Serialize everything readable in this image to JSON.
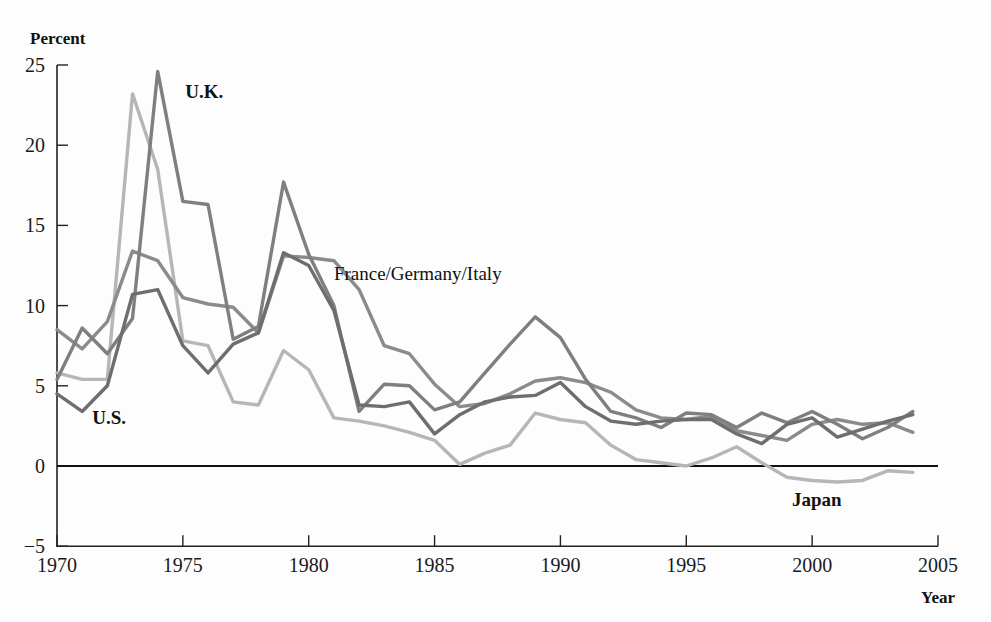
{
  "chart_data": {
    "type": "line",
    "title": "",
    "subtitle": "",
    "xlabel": "Year",
    "ylabel": "Percent",
    "xlim": [
      1970,
      2005
    ],
    "ylim": [
      -5,
      25
    ],
    "xticks": [
      1970,
      1975,
      1980,
      1985,
      1990,
      1995,
      2000,
      2005
    ],
    "yticks": [
      -5,
      0,
      5,
      10,
      15,
      20,
      25
    ],
    "xtick_labels": [
      "1970",
      "1975",
      "1980",
      "1985",
      "1990",
      "1995",
      "2000",
      "2005"
    ],
    "ytick_labels": [
      "−5",
      "0",
      "5",
      "10",
      "15",
      "20",
      "25"
    ],
    "grid": false,
    "legend_position": "inline-annotations",
    "x": [
      1970,
      1971,
      1972,
      1973,
      1974,
      1975,
      1976,
      1977,
      1978,
      1979,
      1980,
      1981,
      1982,
      1983,
      1984,
      1985,
      1986,
      1987,
      1988,
      1989,
      1990,
      1991,
      1992,
      1993,
      1994,
      1995,
      1996,
      1997,
      1998,
      1999,
      2000,
      2001,
      2002,
      2003,
      2004
    ],
    "series": [
      {
        "name": "U.K.",
        "color": "#7f7f7f",
        "label_x": 1975.1,
        "label_y": 23.3,
        "values": [
          5.4,
          8.6,
          7.0,
          9.2,
          24.6,
          16.5,
          16.3,
          7.9,
          8.7,
          17.7,
          13.2,
          10.0,
          3.4,
          5.1,
          5.0,
          3.5,
          4.0,
          5.8,
          7.6,
          9.3,
          8.0,
          5.4,
          3.4,
          3.0,
          2.4,
          3.3,
          3.2,
          2.4,
          3.3,
          2.7,
          3.4,
          2.6,
          1.7,
          2.4,
          3.4
        ]
      },
      {
        "name": "France/Germany/Italy",
        "color": "#8b8b8b",
        "label_x": 1981.0,
        "label_y": 12.0,
        "values": [
          8.5,
          7.3,
          9.0,
          13.4,
          12.8,
          10.5,
          10.1,
          9.9,
          8.3,
          13.1,
          13.0,
          12.8,
          11.0,
          7.5,
          7.0,
          5.1,
          3.7,
          3.9,
          4.5,
          5.3,
          5.5,
          5.2,
          4.6,
          3.5,
          3.0,
          2.9,
          3.1,
          2.2,
          1.9,
          1.6,
          2.6,
          2.9,
          2.6,
          2.7,
          2.1
        ]
      },
      {
        "name": "U.S.",
        "color": "#6e6e6e",
        "label_x": 1971.4,
        "label_y": 3.0,
        "values": [
          4.5,
          3.4,
          5.0,
          10.7,
          11.0,
          7.5,
          5.8,
          7.6,
          8.3,
          13.3,
          12.5,
          9.7,
          3.8,
          3.7,
          4.0,
          2.0,
          3.2,
          4.0,
          4.3,
          4.4,
          5.2,
          3.7,
          2.8,
          2.6,
          2.8,
          2.9,
          2.9,
          2.0,
          1.4,
          2.6,
          3.0,
          1.8,
          2.3,
          2.8,
          3.2
        ]
      },
      {
        "name": "Japan",
        "color": "#b6b6b6",
        "label_x": 1999.2,
        "label_y": -2.1,
        "values": [
          5.8,
          5.4,
          5.4,
          23.2,
          18.5,
          7.8,
          7.5,
          4.0,
          3.8,
          7.2,
          6.0,
          3.0,
          2.8,
          2.5,
          2.1,
          1.6,
          0.1,
          0.8,
          1.3,
          3.3,
          2.9,
          2.7,
          1.3,
          0.4,
          0.2,
          0.0,
          0.5,
          1.2,
          0.2,
          -0.7,
          -0.9,
          -1.0,
          -0.9,
          -0.3,
          -0.4
        ]
      }
    ],
    "annotations": [
      {
        "text": "U.K.",
        "x": 1975.1,
        "y": 23.3
      },
      {
        "text": "France/Germany/Italy",
        "x": 1981.0,
        "y": 12.0
      },
      {
        "text": "U.S.",
        "x": 1971.4,
        "y": 3.0
      },
      {
        "text": "Japan",
        "x": 1999.2,
        "y": -2.1
      }
    ]
  },
  "axes": {
    "y_axis_title": "Percent",
    "x_axis_title": "Year"
  }
}
